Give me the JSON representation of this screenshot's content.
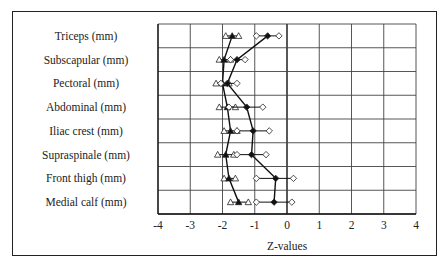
{
  "chart_data": {
    "type": "scatter",
    "title": "",
    "xlabel": "Z-values",
    "ylabel": "",
    "xlim": [
      -4,
      4
    ],
    "xticks": [
      "-4",
      "-3",
      "-2",
      "-1",
      "0",
      "1",
      "2",
      "3",
      "4"
    ],
    "grid": true,
    "categories": [
      "Triceps (mm)",
      "Subscapular (mm)",
      "Pectoral (mm)",
      "Abdominal (mm)",
      "Iliac crest (mm)",
      "Supraspinale (mm)",
      "Front thigh (mm)",
      "Medial calf (mm)"
    ],
    "series": [
      {
        "name": "Group A (triangles)",
        "marker": "triangle",
        "mean": [
          -1.7,
          -1.95,
          -2.0,
          -1.85,
          -1.75,
          -1.9,
          -1.8,
          -1.5
        ],
        "low": [
          -1.9,
          -2.1,
          -2.2,
          -2.1,
          -1.95,
          -2.15,
          -1.95,
          -1.75
        ],
        "high": [
          -1.5,
          -1.75,
          -1.8,
          -1.6,
          -1.55,
          -1.65,
          -1.6,
          -1.2
        ]
      },
      {
        "name": "Group B (diamonds)",
        "marker": "diamond",
        "mean": [
          -0.6,
          -1.55,
          -1.85,
          -1.25,
          -1.05,
          -1.1,
          -0.35,
          -0.4
        ],
        "low": [
          -0.95,
          -1.75,
          -2.05,
          -1.8,
          -1.55,
          -1.55,
          -0.95,
          -0.95
        ],
        "high": [
          -0.25,
          -1.3,
          -1.55,
          -0.75,
          -0.55,
          -0.65,
          0.2,
          0.15
        ]
      }
    ]
  }
}
